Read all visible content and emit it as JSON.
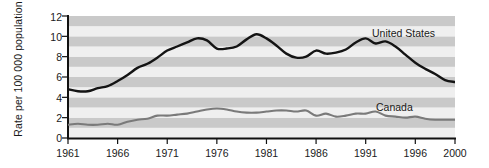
{
  "chart_data": {
    "type": "line",
    "title": "",
    "xlabel": "",
    "ylabel": "Rate per 100 000 population",
    "xlim": [
      1961,
      2000
    ],
    "ylim": [
      0,
      12
    ],
    "grid": "horizontal-bands",
    "legend_position": "inline-right",
    "x_ticks": [
      1961,
      1966,
      1971,
      1976,
      1981,
      1986,
      1991,
      1996,
      2000
    ],
    "y_ticks": [
      0,
      2,
      4,
      6,
      8,
      10,
      12
    ],
    "x": [
      1961,
      1962,
      1963,
      1964,
      1965,
      1966,
      1967,
      1968,
      1969,
      1970,
      1971,
      1972,
      1973,
      1974,
      1975,
      1976,
      1977,
      1978,
      1979,
      1980,
      1981,
      1982,
      1983,
      1984,
      1985,
      1986,
      1987,
      1988,
      1989,
      1990,
      1991,
      1992,
      1993,
      1994,
      1995,
      1996,
      1997,
      1998,
      1999,
      2000
    ],
    "series": [
      {
        "name": "United States",
        "color": "#141414",
        "values": [
          4.8,
          4.6,
          4.6,
          4.9,
          5.1,
          5.6,
          6.2,
          6.9,
          7.3,
          7.9,
          8.6,
          9.0,
          9.4,
          9.8,
          9.6,
          8.8,
          8.8,
          9.0,
          9.7,
          10.2,
          9.8,
          9.1,
          8.3,
          7.9,
          8.0,
          8.6,
          8.3,
          8.4,
          8.7,
          9.4,
          9.8,
          9.3,
          9.5,
          9.0,
          8.2,
          7.4,
          6.8,
          6.3,
          5.7,
          5.5
        ]
      },
      {
        "name": "Canada",
        "color": "#7a7a7a",
        "values": [
          1.3,
          1.4,
          1.3,
          1.3,
          1.4,
          1.3,
          1.6,
          1.8,
          1.9,
          2.2,
          2.2,
          2.3,
          2.4,
          2.6,
          2.8,
          2.9,
          2.8,
          2.6,
          2.5,
          2.5,
          2.6,
          2.7,
          2.7,
          2.6,
          2.7,
          2.2,
          2.4,
          2.1,
          2.2,
          2.4,
          2.4,
          2.6,
          2.2,
          2.1,
          2.0,
          2.1,
          1.9,
          1.8,
          1.8,
          1.8
        ]
      }
    ]
  },
  "labels": {
    "united_states": "United States",
    "canada": "Canada",
    "y_axis_title": "Rate per 100 000 population"
  },
  "ticks": {
    "y": [
      "12",
      "10",
      "8",
      "6",
      "4",
      "2",
      "0"
    ],
    "x": [
      "1961",
      "1966",
      "1971",
      "1976",
      "1981",
      "1986",
      "1991",
      "1996",
      "2000"
    ]
  },
  "colors": {
    "band_light": "#efefef",
    "band_dark": "#c9c9c9",
    "axis": "#111111",
    "us_line": "#141414",
    "canada_line": "#7a7a7a",
    "text": "#1a1a1a"
  }
}
